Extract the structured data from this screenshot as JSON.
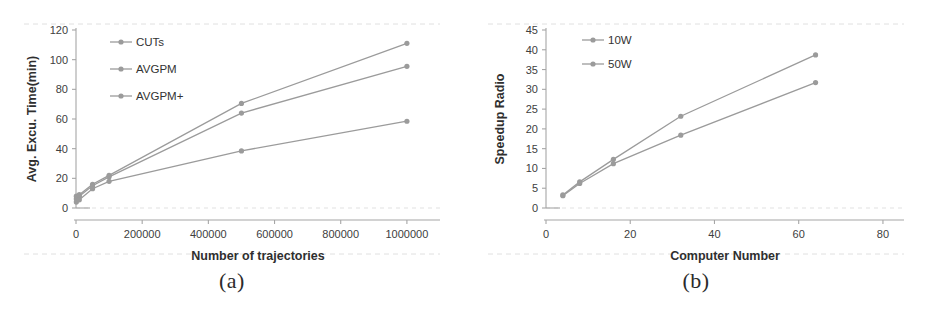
{
  "figure": {
    "panels": [
      {
        "caption": "(a)",
        "legend_position": "top-left",
        "chart_data": {
          "type": "line",
          "title": "",
          "xlabel": "Number of trajectories",
          "ylabel": "Avg. Excu. Time(min)",
          "x": [
            1000,
            10000,
            50000,
            100000,
            500000,
            1000000
          ],
          "xlim": [
            0,
            1100000
          ],
          "ylim": [
            0,
            120
          ],
          "xticks": [
            0,
            200000,
            400000,
            600000,
            800000,
            1000000
          ],
          "xtick_labels": [
            "0",
            "200000",
            "400000",
            "600000",
            "800000",
            "1000000"
          ],
          "yticks": [
            0,
            20,
            40,
            60,
            80,
            100,
            120
          ],
          "ytick_labels": [
            "0",
            "20",
            "40",
            "60",
            "80",
            "100",
            "120"
          ],
          "grid": false,
          "series": [
            {
              "name": "CUTs",
              "values": [
                8,
                9,
                16,
                22,
                70.5,
                111
              ]
            },
            {
              "name": "AVGPM",
              "values": [
                6,
                8,
                15,
                21,
                64,
                95.5
              ]
            },
            {
              "name": "AVGPM+",
              "values": [
                4,
                5.5,
                13,
                18,
                38.5,
                58.5
              ]
            }
          ]
        }
      },
      {
        "caption": "(b)",
        "legend_position": "top-left",
        "chart_data": {
          "type": "line",
          "title": "",
          "xlabel": "Computer Number",
          "ylabel": "Speedup Radio",
          "x": [
            4,
            8,
            16,
            32,
            64
          ],
          "xlim": [
            0,
            85
          ],
          "ylim": [
            0,
            45
          ],
          "xticks": [
            0,
            20,
            40,
            60,
            80
          ],
          "xtick_labels": [
            "0",
            "20",
            "40",
            "60",
            "80"
          ],
          "yticks": [
            0,
            5,
            10,
            15,
            20,
            25,
            30,
            35,
            40,
            45
          ],
          "ytick_labels": [
            "0",
            "5",
            "10",
            "15",
            "20",
            "25",
            "30",
            "35",
            "40",
            "45"
          ],
          "grid": false,
          "series": [
            {
              "name": "10W",
              "values": [
                3.1,
                6.2,
                11.2,
                18.4,
                31.7
              ]
            },
            {
              "name": "50W",
              "values": [
                3.3,
                6.6,
                12.3,
                23.2,
                38.7
              ]
            }
          ]
        }
      }
    ],
    "colors": {
      "series": "#9b9b9b",
      "axis": "#a6a6a6",
      "text": "#333333",
      "background": "#ffffff"
    }
  }
}
